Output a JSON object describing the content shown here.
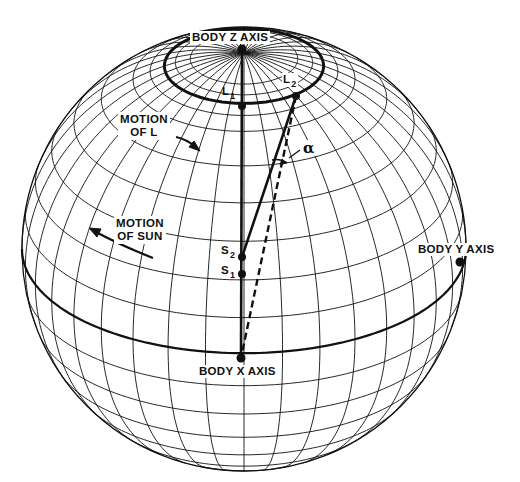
{
  "figure": {
    "background": "#ffffff",
    "ink": "#111111"
  },
  "sphere": {
    "cx": 244,
    "cy": 249,
    "r": 222,
    "tilt_deg": 28,
    "meridian_step_deg": 10,
    "latitude_circles_deg": [
      -80,
      -70,
      -60,
      -50,
      -40,
      -30,
      -20,
      -10,
      10,
      20,
      30,
      40,
      50,
      60,
      65,
      69,
      72,
      76
    ],
    "thick_latitude_deg": 69,
    "equator_thick": true
  },
  "labels": {
    "body_z_axis": "BODY Z AXIS",
    "body_y_axis": "BODY Y AXIS",
    "body_x_axis": "BODY X AXIS",
    "motion_of_l_line1": "MOTION",
    "motion_of_l_line2": "OF L",
    "motion_of_sun_line1": "MOTION",
    "motion_of_sun_line2": "OF SUN",
    "l1": "L",
    "l1_sub": "1",
    "l2": "L",
    "l2_sub": "2",
    "s1": "S",
    "s1_sub": "1",
    "s2": "S",
    "s2_sub": "2",
    "alpha": "α"
  },
  "points": {
    "z_axis": [
      242,
      49
    ],
    "l1": [
      242,
      106
    ],
    "l2": [
      296,
      96
    ],
    "s2": [
      242,
      257
    ],
    "s1": [
      242,
      274
    ],
    "x_axis": [
      241,
      358
    ],
    "y_axis": [
      460,
      262
    ]
  }
}
